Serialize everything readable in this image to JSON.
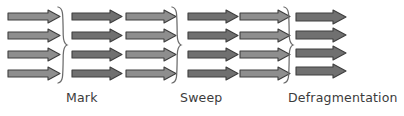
{
  "diagram": {
    "background_color": "#ffffff",
    "width": 404,
    "height": 116,
    "arrow_outline_color": "#3f3f3f",
    "arrow_fill_light": "#8e8e8e",
    "arrow_fill_dark": "#707070",
    "brace_color": "#6b6b6b",
    "label_color": "#3b3b3b",
    "groups": [
      {
        "id": "group-1-initial-heap",
        "x": 8,
        "shade": "light",
        "fill": "#8e8e8e",
        "arrow_count": 4,
        "arrow_width": 52,
        "arrow_height": 13,
        "row_ys": [
          10,
          29,
          48,
          67
        ],
        "compacted": false
      },
      {
        "id": "group-2-marked-heap",
        "x": 72,
        "shade": "dark",
        "fill": "#707070",
        "arrow_count": 4,
        "arrow_width": 50,
        "arrow_height": 13,
        "row_ys": [
          10,
          29,
          48,
          67
        ],
        "compacted": false
      },
      {
        "id": "group-3-pre-sweep-heap",
        "x": 126,
        "shade": "light",
        "fill": "#8e8e8e",
        "arrow_count": 4,
        "arrow_width": 50,
        "arrow_height": 13,
        "row_ys": [
          10,
          29,
          48,
          67
        ],
        "compacted": false
      },
      {
        "id": "group-4-swept-heap",
        "x": 188,
        "shade": "dark",
        "fill": "#707070",
        "arrow_count": 4,
        "arrow_width": 50,
        "arrow_height": 13,
        "row_ys": [
          10,
          29,
          48,
          67
        ],
        "compacted": false
      },
      {
        "id": "group-5-pre-defrag-heap",
        "x": 240,
        "shade": "light",
        "fill": "#8e8e8e",
        "arrow_count": 4,
        "arrow_width": 50,
        "arrow_height": 13,
        "row_ys": [
          10,
          29,
          48,
          67
        ],
        "compacted": false
      },
      {
        "id": "group-6-defragmented-heap",
        "x": 296,
        "shade": "dark",
        "fill": "#707070",
        "arrow_count": 4,
        "arrow_width": 50,
        "arrow_height": 14,
        "row_ys": [
          10,
          28,
          46,
          64
        ],
        "compacted": true
      }
    ],
    "braces": [
      {
        "id": "brace-mark",
        "x": 56,
        "y": 6,
        "height": 78
      },
      {
        "id": "brace-sweep",
        "x": 170,
        "y": 6,
        "height": 78
      },
      {
        "id": "brace-defragmentation",
        "x": 282,
        "y": 6,
        "height": 78
      }
    ],
    "labels": [
      {
        "id": "label-mark",
        "text": "Mark",
        "x": 66,
        "y": 92
      },
      {
        "id": "label-sweep",
        "text": "Sweep",
        "x": 180,
        "y": 92
      },
      {
        "id": "label-defragmentation",
        "text": "Defragmentation",
        "x": 288,
        "y": 92
      }
    ]
  }
}
